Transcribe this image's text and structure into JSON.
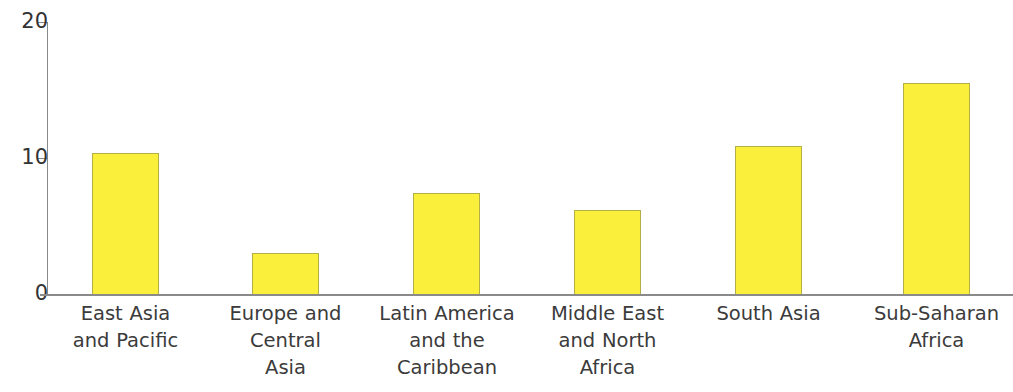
{
  "chart_data": {
    "type": "bar",
    "title": "",
    "subtitle": "",
    "xlabel": "",
    "ylabel": "",
    "categories": [
      "East Asia and Pacific",
      "Europe and Central Asia",
      "Latin America and the Caribbean",
      "Middle East and North Africa",
      "South Asia",
      "Sub-Saharan Africa"
    ],
    "values": [
      10.4,
      3.0,
      7.4,
      6.2,
      10.9,
      15.5
    ],
    "ylim": [
      0,
      20
    ],
    "yticks": [
      0,
      10,
      20
    ],
    "ytick_labels": [
      "0",
      "10",
      "20"
    ],
    "grid": false,
    "legend": "none",
    "bar_color": "#faf03c",
    "bar_border_color": "#b3ae45",
    "axis_color": "#8a8a8a",
    "text_color": "#3b3b3b"
  },
  "axis": {
    "y_ticks": [
      {
        "label": "20",
        "value": 20
      },
      {
        "label": "10",
        "value": 10
      },
      {
        "label": "0",
        "value": 0
      }
    ]
  },
  "bars": [
    {
      "label_line1": "East Asia",
      "label_line2": "and Pacific",
      "label_line3": "",
      "value": 10.4
    },
    {
      "label_line1": "Europe and",
      "label_line2": "Central",
      "label_line3": "Asia",
      "value": 3.0
    },
    {
      "label_line1": "Latin America",
      "label_line2": "and the",
      "label_line3": "Caribbean",
      "value": 7.4
    },
    {
      "label_line1": "Middle East",
      "label_line2": "and North",
      "label_line3": "Africa",
      "value": 6.2
    },
    {
      "label_line1": "South Asia",
      "label_line2": "",
      "label_line3": "",
      "value": 10.9
    },
    {
      "label_line1": "Sub-Saharan",
      "label_line2": "Africa",
      "label_line3": "",
      "value": 15.5
    }
  ]
}
